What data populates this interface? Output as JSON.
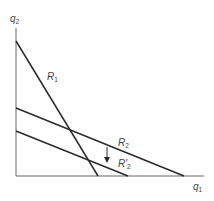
{
  "diagram": {
    "axes": {
      "y_label": "q",
      "y_label_sub": "2",
      "x_label": "q",
      "x_label_sub": "1"
    },
    "lines": [
      {
        "name": "R1",
        "label": "R",
        "sub": "1"
      },
      {
        "name": "R2",
        "label": "R",
        "sub": "2"
      },
      {
        "name": "R2prime",
        "label": "R′",
        "sub": "2"
      }
    ],
    "colors": {
      "line": "#2a2a2a",
      "axis": "#555555",
      "text": "#444444"
    }
  }
}
